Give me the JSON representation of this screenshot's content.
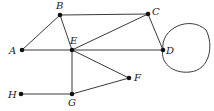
{
  "diagram": {
    "type": "undirected-graph",
    "nodes": [
      {
        "id": "A",
        "label": "A",
        "x": 22,
        "y": 50,
        "lx": 9,
        "ly": 54
      },
      {
        "id": "B",
        "label": "B",
        "x": 60,
        "y": 15,
        "lx": 56,
        "ly": 9
      },
      {
        "id": "C",
        "label": "C",
        "x": 148,
        "y": 14,
        "lx": 152,
        "ly": 15
      },
      {
        "id": "D",
        "label": "D",
        "x": 163,
        "y": 50,
        "lx": 166,
        "ly": 54
      },
      {
        "id": "E",
        "label": "E",
        "x": 72,
        "y": 50,
        "lx": 70,
        "ly": 44
      },
      {
        "id": "F",
        "label": "F",
        "x": 129,
        "y": 78,
        "lx": 134,
        "ly": 81
      },
      {
        "id": "G",
        "label": "G",
        "x": 72,
        "y": 94,
        "lx": 68,
        "ly": 106
      },
      {
        "id": "H",
        "label": "H",
        "x": 21,
        "y": 94,
        "lx": 8,
        "ly": 98
      }
    ],
    "edges": [
      {
        "from": "A",
        "to": "B"
      },
      {
        "from": "A",
        "to": "E"
      },
      {
        "from": "B",
        "to": "C"
      },
      {
        "from": "B",
        "to": "E"
      },
      {
        "from": "E",
        "to": "C"
      },
      {
        "from": "E",
        "to": "D"
      },
      {
        "from": "C",
        "to": "D"
      },
      {
        "from": "E",
        "to": "F"
      },
      {
        "from": "E",
        "to": "G"
      },
      {
        "from": "G",
        "to": "F"
      },
      {
        "from": "H",
        "to": "G"
      }
    ],
    "loops": [
      {
        "node": "D",
        "path": "M 163 50 C 160 28, 190 15, 206 30 C 214 45, 210 70, 190 72 C 172 74, 160 62, 163 50"
      }
    ]
  }
}
